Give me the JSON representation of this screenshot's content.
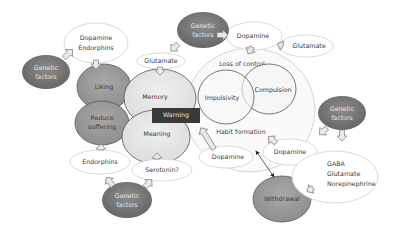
{
  "diagram": {
    "colors": {
      "genetic": "#7a7a7a",
      "dark_node": "#999999",
      "light_node": "#e6e6e6",
      "outline_node": "#ffffff",
      "warning_box": "#3a3a3a",
      "big_circle": "#fafafa"
    },
    "nodes": {
      "genetic_top_left": {
        "line1": "Genetic",
        "line2": "factors"
      },
      "dopamine_endorphins": {
        "line1": "Dopamine",
        "line2": "Endorphins"
      },
      "liking": {
        "label": "Liking"
      },
      "reduce_suffering": {
        "line1": "Reduce",
        "line2": "suffering"
      },
      "glutamate_left": {
        "label": "Glutamate"
      },
      "memory": {
        "label": "Memory"
      },
      "meaning": {
        "label": "Meaning"
      },
      "warning": {
        "label": "Warning"
      },
      "genetic_top_center": {
        "line1": "Genetic",
        "line2": "factors"
      },
      "dopamine_top": {
        "label": "Dopamine"
      },
      "glutamate_top_right": {
        "label": "Glutamate"
      },
      "loss_of_control": {
        "label": "Loss of control"
      },
      "impulsivity": {
        "label": "Impulsivity"
      },
      "compulsion": {
        "label": "Compulsion"
      },
      "habit_formation": {
        "label": "Habit formation"
      },
      "genetic_right": {
        "line1": "Genetic",
        "line2": "factors"
      },
      "dopamine_right": {
        "label": "Dopamine"
      },
      "gaba_group": {
        "line1": "GABA",
        "line2": "Glutamate",
        "line3": "Norepinephrine"
      },
      "withdrawal": {
        "label": "Withdrawal"
      },
      "endorphins_bottom": {
        "label": "Endorphins"
      },
      "serotonin": {
        "label": "Serotonin?"
      },
      "dopamine_bottom": {
        "label": "Dopamine"
      },
      "genetic_bottom": {
        "line1": "Genetic",
        "line2": "factors"
      }
    }
  }
}
